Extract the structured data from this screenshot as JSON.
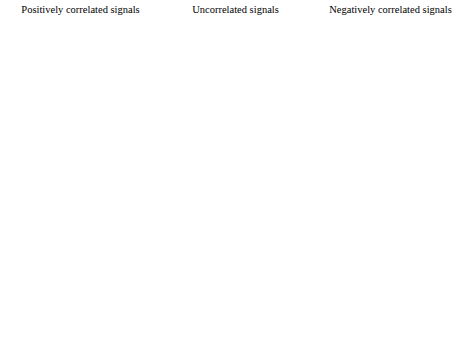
{
  "figure": {
    "columns": [
      {
        "id": "positive",
        "title": "Positively correlated signals"
      },
      {
        "id": "uncorrelated",
        "title": "Uncorrelated signals"
      },
      {
        "id": "negative",
        "title": "Negatively correlated signals"
      }
    ],
    "rows": [
      {
        "id": "x1",
        "label_base": "x",
        "label_sub": "1",
        "label_idx": "[n]"
      },
      {
        "id": "x2",
        "label_base": "x",
        "label_sub": "2",
        "label_idx": "[n]"
      },
      {
        "id": "product",
        "label_base": "x",
        "label_sub": "1",
        "label_idx": "[n]x"
      }
    ],
    "axis": {
      "n_label": "n",
      "tick_pos": "1",
      "tick_neg": "−1",
      "end_label": "48",
      "n_start": 0,
      "n_end": 48
    },
    "annotation_text": "Average of product",
    "colors": {
      "stem": "#8a8a8a",
      "marker": "#111111",
      "axis": "#000000",
      "average_line": "#333333",
      "background": "#ffffff"
    }
  },
  "chart_data": {
    "type": "line",
    "xlabel": "n",
    "ylabel": "amplitude",
    "xlim": [
      0,
      48
    ],
    "ylim": [
      -1,
      1
    ],
    "grid": false,
    "legend": "none",
    "period": 12,
    "cycles": 4,
    "base_waveform_one_period": [
      0.25,
      0.5,
      0.75,
      1.0,
      0.75,
      0.5,
      -0.25,
      -0.5,
      -0.75,
      -1.0,
      -0.75,
      -0.5
    ],
    "panels": [
      {
        "column": "positively correlated signals",
        "row": "x1[n]",
        "phase_shift": 0,
        "values": [
          0.25,
          0.5,
          0.75,
          1,
          0.75,
          0.5,
          -0.25,
          -0.5,
          -0.75,
          -1,
          -0.75,
          -0.5,
          0.25,
          0.5,
          0.75,
          1,
          0.75,
          0.5,
          -0.25,
          -0.5,
          -0.75,
          -1,
          -0.75,
          -0.5,
          0.25,
          0.5,
          0.75,
          1,
          0.75,
          0.5,
          -0.25,
          -0.5,
          -0.75,
          -1,
          -0.75,
          -0.5,
          0.25,
          0.5,
          0.75,
          1,
          0.75,
          0.5,
          -0.25,
          -0.5,
          -0.75,
          -1,
          -0.75,
          -0.5
        ]
      },
      {
        "column": "positively correlated signals",
        "row": "x2[n]",
        "phase_shift": 0,
        "values": [
          0.25,
          0.5,
          0.75,
          1,
          0.75,
          0.5,
          -0.25,
          -0.5,
          -0.75,
          -1,
          -0.75,
          -0.5,
          0.25,
          0.5,
          0.75,
          1,
          0.75,
          0.5,
          -0.25,
          -0.5,
          -0.75,
          -1,
          -0.75,
          -0.5,
          0.25,
          0.5,
          0.75,
          1,
          0.75,
          0.5,
          -0.25,
          -0.5,
          -0.75,
          -1,
          -0.75,
          -0.5,
          0.25,
          0.5,
          0.75,
          1,
          0.75,
          0.5,
          -0.25,
          -0.5,
          -0.75,
          -1,
          -0.75,
          -0.5
        ]
      },
      {
        "column": "positively correlated signals",
        "row": "x1[n]x2[n]",
        "average": 0.48,
        "average_visible": true,
        "values": [
          0.0625,
          0.25,
          0.5625,
          1,
          0.5625,
          0.25,
          0.0625,
          0.25,
          0.5625,
          1,
          0.5625,
          0.25,
          0.0625,
          0.25,
          0.5625,
          1,
          0.5625,
          0.25,
          0.0625,
          0.25,
          0.5625,
          1,
          0.5625,
          0.25,
          0.0625,
          0.25,
          0.5625,
          1,
          0.5625,
          0.25,
          0.0625,
          0.25,
          0.5625,
          1,
          0.5625,
          0.25,
          0.0625,
          0.25,
          0.5625,
          1,
          0.5625,
          0.25,
          0.0625,
          0.25,
          0.5625,
          1,
          0.5625,
          0.25
        ]
      },
      {
        "column": "uncorrelated signals",
        "row": "x1[n]",
        "phase_shift": 3,
        "values": [
          1,
          0.75,
          0.5,
          -0.25,
          -0.5,
          -0.75,
          -1,
          -0.75,
          -0.5,
          0.25,
          0.5,
          0.75,
          1,
          0.75,
          0.5,
          -0.25,
          -0.5,
          -0.75,
          -1,
          -0.75,
          -0.5,
          0.25,
          0.5,
          0.75,
          1,
          0.75,
          0.5,
          -0.25,
          -0.5,
          -0.75,
          -1,
          -0.75,
          -0.5,
          0.25,
          0.5,
          0.75,
          1,
          0.75,
          0.5,
          -0.25,
          -0.5,
          -0.75,
          -1,
          -0.75,
          -0.5,
          0.25,
          0.5,
          0.75
        ]
      },
      {
        "column": "uncorrelated signals",
        "row": "x2[n]",
        "phase_shift": 0,
        "values": [
          0.25,
          0.5,
          0.75,
          1,
          0.75,
          0.5,
          -0.25,
          -0.5,
          -0.75,
          -1,
          -0.75,
          -0.5,
          0.25,
          0.5,
          0.75,
          1,
          0.75,
          0.5,
          -0.25,
          -0.5,
          -0.75,
          -1,
          -0.75,
          -0.5,
          0.25,
          0.5,
          0.75,
          1,
          0.75,
          0.5,
          -0.25,
          -0.5,
          -0.75,
          -1,
          -0.75,
          -0.5,
          0.25,
          0.5,
          0.75,
          1,
          0.75,
          0.5,
          -0.25,
          -0.5,
          -0.75,
          -1,
          -0.75,
          -0.5
        ]
      },
      {
        "column": "uncorrelated signals",
        "row": "x1[n]x2[n]",
        "average": 0.0,
        "average_visible": false,
        "values": [
          0.25,
          0.375,
          0.375,
          -0.25,
          -0.375,
          -0.375,
          0.25,
          0.375,
          0.375,
          -0.25,
          -0.375,
          -0.375,
          0.25,
          0.375,
          0.375,
          -0.25,
          -0.375,
          -0.375,
          0.25,
          0.375,
          0.375,
          -0.25,
          -0.375,
          -0.375,
          0.25,
          0.375,
          0.375,
          -0.25,
          -0.375,
          -0.375,
          0.25,
          0.375,
          0.375,
          -0.25,
          -0.375,
          -0.375,
          0.25,
          0.375,
          0.375,
          -0.25,
          -0.375,
          -0.375,
          0.25,
          0.375,
          0.375,
          -0.25,
          -0.375,
          -0.375
        ]
      },
      {
        "column": "negatively correlated signals",
        "row": "x1[n]",
        "phase_shift": 6,
        "values": [
          -0.25,
          -0.5,
          -0.75,
          -1,
          -0.75,
          -0.5,
          0.25,
          0.5,
          0.75,
          1,
          0.75,
          0.5,
          -0.25,
          -0.5,
          -0.75,
          -1,
          -0.75,
          -0.5,
          0.25,
          0.5,
          0.75,
          1,
          0.75,
          0.5,
          -0.25,
          -0.5,
          -0.75,
          -1,
          -0.75,
          -0.5,
          0.25,
          0.5,
          0.75,
          1,
          0.75,
          0.5,
          -0.25,
          -0.5,
          -0.75,
          -1,
          -0.75,
          -0.5,
          0.25,
          0.5,
          0.75,
          1,
          0.75,
          0.5
        ]
      },
      {
        "column": "negatively correlated signals",
        "row": "x2[n]",
        "phase_shift": 0,
        "values": [
          0.25,
          0.5,
          0.75,
          1,
          0.75,
          0.5,
          -0.25,
          -0.5,
          -0.75,
          -1,
          -0.75,
          -0.5,
          0.25,
          0.5,
          0.75,
          1,
          0.75,
          0.5,
          -0.25,
          -0.5,
          -0.75,
          -1,
          -0.75,
          -0.5,
          0.25,
          0.5,
          0.75,
          1,
          0.75,
          0.5,
          -0.25,
          -0.5,
          -0.75,
          -1,
          -0.75,
          -0.5,
          0.25,
          0.5,
          0.75,
          1,
          0.75,
          0.5,
          -0.25,
          -0.5,
          -0.75,
          -1,
          -0.75,
          -0.5
        ]
      },
      {
        "column": "negatively correlated signals",
        "row": "x1[n]x2[n]",
        "average": -0.48,
        "average_visible": true,
        "values": [
          -0.0625,
          -0.25,
          -0.5625,
          -1,
          -0.5625,
          -0.25,
          -0.0625,
          -0.25,
          -0.5625,
          -1,
          -0.5625,
          -0.25,
          -0.0625,
          -0.25,
          -0.5625,
          -1,
          -0.5625,
          -0.25,
          -0.0625,
          -0.25,
          -0.5625,
          -1,
          -0.5625,
          -0.25,
          -0.0625,
          -0.25,
          -0.5625,
          -1,
          -0.5625,
          -0.25,
          -0.0625,
          -0.25,
          -0.5625,
          -1,
          -0.5625,
          -0.25,
          -0.0625,
          -0.25,
          -0.5625,
          -1,
          -0.5625,
          -0.25,
          -0.0625,
          -0.25,
          -0.5625,
          -1,
          -0.5625,
          -0.25
        ]
      }
    ]
  }
}
